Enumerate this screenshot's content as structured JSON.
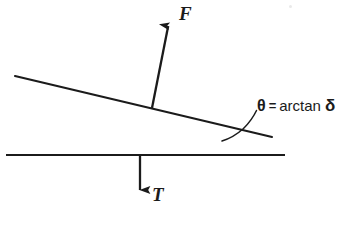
{
  "figure": {
    "type": "free-body-force-diagram",
    "background_color": "#ffffff",
    "stroke_color": "#1b1b1b",
    "labels": {
      "force_vector": "F",
      "tension_vector": "T",
      "angle_symbol": "θ",
      "equals_sign": "=",
      "function_name": "arctan",
      "slope_symbol": "δ"
    },
    "annotation_full_text": "θ = arctan δ",
    "elements": {
      "inclined_line": {
        "name": "inclined-surface-line",
        "x1": 15,
        "y1": 76,
        "x2": 272,
        "y2": 137
      },
      "horizontal_line": {
        "name": "horizontal-reference-line",
        "x1": 6,
        "y1": 155,
        "x2": 285,
        "y2": 155
      },
      "force_arrow": {
        "name": "force-vector-arrow",
        "x1": 152,
        "y1": 108,
        "x2": 170,
        "y2": 17,
        "direction": "up-right"
      },
      "tension_arrow": {
        "name": "tension-vector-arrow",
        "x1": 140,
        "y1": 155,
        "x2": 140,
        "y2": 201,
        "direction": "down"
      },
      "angle_arc": {
        "name": "angle-marker-arc",
        "start_x": 222,
        "start_y": 141,
        "end_x": 256,
        "end_y": 110
      },
      "leader_line": {
        "name": "annotation-leader-line",
        "x1": 243,
        "y1": 117,
        "x2": 258,
        "y2": 105
      }
    }
  }
}
